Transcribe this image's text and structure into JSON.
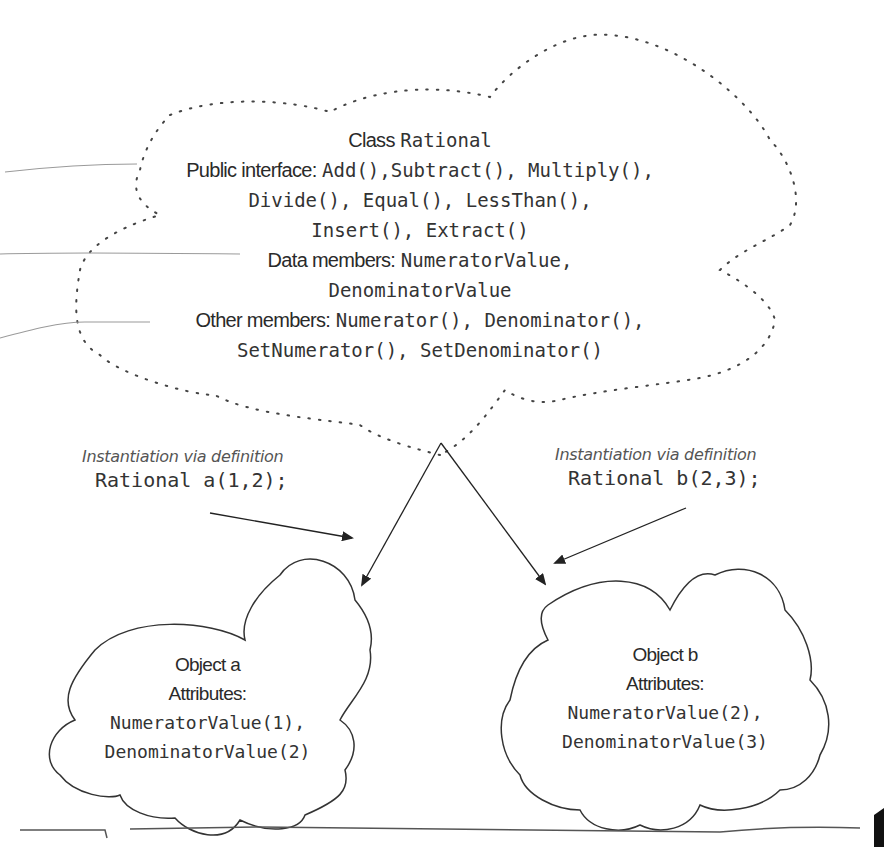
{
  "class_cloud": {
    "title_prefix": "Class",
    "title_name": "Rational",
    "public_label": "Public interface:",
    "public_line1": "Add(),Subtract(), Multiply(),",
    "public_line2": "Divide(), Equal(), LessThan(),",
    "public_line3": "Insert(), Extract()",
    "data_label": "Data members:",
    "data_line1": "NumeratorValue,",
    "data_line2": "DenominatorValue",
    "other_label": "Other members:",
    "other_line1": "Numerator(), Denominator(),",
    "other_line2": "SetNumerator(), SetDenominator()"
  },
  "instantiation_a": {
    "caption": "Instantiation via definition",
    "code": "Rational a(1,2);"
  },
  "instantiation_b": {
    "caption": "Instantiation via definition",
    "code": "Rational b(2,3);"
  },
  "object_a": {
    "title": "Object a",
    "attributes_label": "Attributes:",
    "attr1": "NumeratorValue(1),",
    "attr2": "DenominatorValue(2)"
  },
  "object_b": {
    "title": "Object b",
    "attributes_label": "Attributes:",
    "attr1": "NumeratorValue(2),",
    "attr2": "DenominatorValue(3)"
  },
  "colors": {
    "ink": "#333333",
    "dotted_outline": "#444444",
    "leader_lines": "#9a9a9a"
  }
}
